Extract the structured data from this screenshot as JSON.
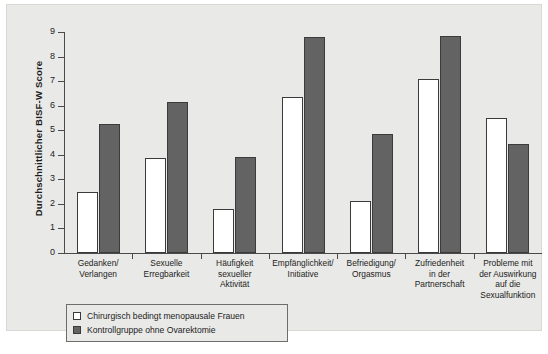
{
  "chart_data": {
    "type": "bar",
    "title": "",
    "xlabel": "",
    "ylabel": "Durchschnittlicher BISF-W Score",
    "ylim": [
      0,
      9
    ],
    "yticks": [
      0,
      1,
      2,
      3,
      4,
      5,
      6,
      7,
      8,
      9
    ],
    "ytick_labels": [
      "0",
      "1",
      "2",
      "3",
      "4",
      "5",
      "6",
      "7",
      "8",
      "9"
    ],
    "grid": false,
    "legend_position": "below-left",
    "categories": [
      "Gedanken/\nVerlangen",
      "Sexuelle\nErregbarkeit",
      "Häufigkeit\nsexueller\nAktivität",
      "Empfänglichkeit/\nInitiative",
      "Befriedigung/\nOrgasmus",
      "Zufriedenheit\nin der\nPartnerschaft",
      "Probleme mit\nder Auswirkung\nauf die\nSexualfunktion"
    ],
    "category_lines": [
      [
        "Gedanken/",
        "Verlangen"
      ],
      [
        "Sexuelle",
        "Erregbarkeit"
      ],
      [
        "Häufigkeit",
        "sexueller",
        "Aktivität"
      ],
      [
        "Empfänglichkeit/",
        "Initiative"
      ],
      [
        "Befriedigung/",
        "Orgasmus"
      ],
      [
        "Zufriedenheit",
        "in der",
        "Partnerschaft"
      ],
      [
        "Probleme mit",
        "der Auswirkung",
        "auf die",
        "Sexualfunktion"
      ]
    ],
    "series": [
      {
        "name": "Chirurgisch bedingt menopausale Frauen",
        "color": "#ffffff",
        "values": [
          2.5,
          3.85,
          1.8,
          6.35,
          2.1,
          7.1,
          5.5
        ]
      },
      {
        "name": "Kontrollgruppe ohne Ovarektomie",
        "color": "#636363",
        "values": [
          5.25,
          6.15,
          3.9,
          8.8,
          4.85,
          8.85,
          4.45
        ]
      }
    ]
  },
  "legend": {
    "items": [
      {
        "label": "Chirurgisch bedingt menopausale Frauen",
        "swatch": "light"
      },
      {
        "label": "Kontrollgruppe ohne Ovarektomie",
        "swatch": "dark"
      }
    ]
  },
  "colors": {
    "plate_background": "#e9e9e7",
    "page_background": "#ffffff",
    "axis": "#4a4a4a",
    "bar_light": "#ffffff",
    "bar_dark": "#636363",
    "bar_outline": "#3b3b3b",
    "text": "#1c1c1c"
  }
}
